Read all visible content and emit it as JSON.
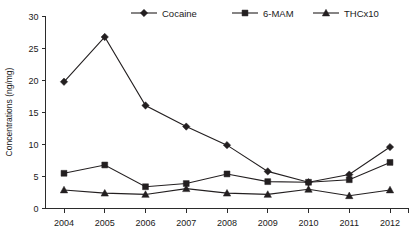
{
  "chart_data": {
    "type": "line",
    "title": "",
    "xlabel": "",
    "ylabel": "Concentrations (ng/mg)",
    "categories": [
      "2004",
      "2005",
      "2006",
      "2007",
      "2008",
      "2009",
      "2010",
      "2011",
      "2012"
    ],
    "x": [
      2004,
      2005,
      2006,
      2007,
      2008,
      2009,
      2010,
      2011,
      2012
    ],
    "ylim": [
      0,
      30
    ],
    "xlim": [
      2004,
      2012
    ],
    "yticks": [
      0,
      5,
      10,
      15,
      20,
      25,
      30
    ],
    "ytick_labels": [
      "0",
      "5",
      "10",
      "15",
      "20",
      "25",
      "30"
    ],
    "xtick_labels": [
      "2004",
      "2005",
      "2006",
      "2007",
      "2008",
      "2009",
      "2010",
      "2011",
      "2012"
    ],
    "grid": false,
    "legend_position": "top-center",
    "series": [
      {
        "name": "Cocaine",
        "marker": "diamond",
        "color": "#231f20",
        "values": [
          19.8,
          26.8,
          16.1,
          12.8,
          9.9,
          5.8,
          4.1,
          5.3,
          9.6
        ]
      },
      {
        "name": "6-MAM",
        "marker": "square",
        "color": "#231f20",
        "values": [
          5.5,
          6.8,
          3.4,
          3.9,
          5.4,
          4.2,
          4.1,
          4.5,
          7.2
        ]
      },
      {
        "name": "THCx10",
        "marker": "triangle",
        "color": "#231f20",
        "values": [
          2.9,
          2.4,
          2.2,
          3.1,
          2.4,
          2.2,
          3.0,
          2.0,
          2.9
        ]
      }
    ]
  },
  "legend": {
    "items": [
      {
        "label": "Cocaine",
        "marker": "diamond"
      },
      {
        "label": "6-MAM",
        "marker": "square"
      },
      {
        "label": "THCx10",
        "marker": "triangle"
      }
    ]
  },
  "axes": {
    "y_title": "Concentrations (ng/mg)"
  }
}
